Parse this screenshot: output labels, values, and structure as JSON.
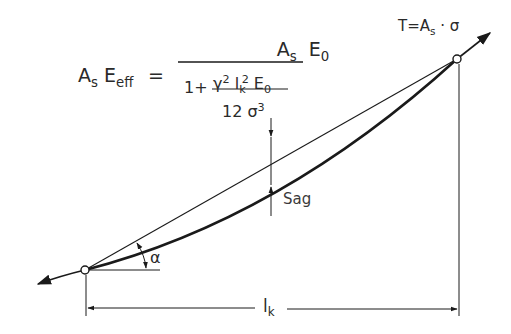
{
  "diagram": {
    "type": "cable-sag-effective-modulus",
    "formula": {
      "lhs_A": "A",
      "lhs_A_sub": "s",
      "lhs_E": "E",
      "lhs_E_sub": "eff",
      "equals": "=",
      "numerator_A": "A",
      "numerator_A_sub": "s",
      "numerator_E": "E",
      "numerator_E_sub": "0",
      "denominator_one_plus": "1+",
      "inner_num_gamma": "γ",
      "inner_num_gamma_sup": "2",
      "inner_num_l": "l",
      "inner_num_l_sub": "k",
      "inner_num_l_sup": "2",
      "inner_num_E": "E",
      "inner_num_E_sub": "0",
      "inner_den_12": "12",
      "inner_den_sigma": "σ",
      "inner_den_sigma_sup": "3"
    },
    "force_label": {
      "T": "T",
      "eq": "=",
      "A": "A",
      "A_sub": "s",
      "dot": "·",
      "sigma": "σ"
    },
    "sag_label": "Sag",
    "angle_label": "α",
    "span_label": "l",
    "span_label_sub": "k",
    "colors": {
      "line": "#1a1a1a",
      "text": "#2a2a2a",
      "background": "#ffffff"
    }
  }
}
